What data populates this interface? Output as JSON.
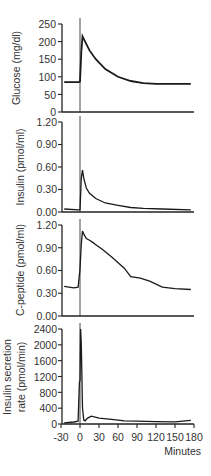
{
  "chart_data": [
    {
      "type": "line",
      "title": "",
      "xlabel": "",
      "ylabel": "Glucose (mg/dl)",
      "ylim": [
        0,
        250
      ],
      "yticks": [
        "0",
        "50",
        "100",
        "150",
        "200",
        "250"
      ],
      "xlim": [
        -30,
        180
      ],
      "injection_marker_x": 0,
      "series": [
        {
          "name": "Glucose",
          "x": [
            -25,
            -2,
            0,
            2,
            4,
            8,
            15,
            25,
            40,
            60,
            80,
            100,
            120,
            150,
            175
          ],
          "values": [
            85,
            85,
            86,
            170,
            215,
            200,
            175,
            150,
            122,
            100,
            88,
            82,
            80,
            80,
            80
          ]
        }
      ]
    },
    {
      "type": "line",
      "ylabel": "Insulin (pmol/ml)",
      "ylim": [
        0,
        1.2
      ],
      "yticks": [
        "0.00",
        "0.30",
        "0.60",
        "0.90",
        "1.20"
      ],
      "xlim": [
        -30,
        180
      ],
      "injection_marker_x": 0,
      "series": [
        {
          "name": "Insulin",
          "x": [
            -25,
            -2,
            0,
            2,
            4,
            6,
            10,
            15,
            25,
            40,
            60,
            80,
            100,
            130,
            175
          ],
          "values": [
            0.04,
            0.03,
            0.03,
            0.45,
            0.56,
            0.45,
            0.32,
            0.25,
            0.18,
            0.12,
            0.09,
            0.06,
            0.05,
            0.04,
            0.03
          ]
        }
      ]
    },
    {
      "type": "line",
      "ylabel": "C-peptide (pmol/ml)",
      "ylim": [
        0,
        1.2
      ],
      "yticks": [
        "0.00",
        "0.30",
        "0.60",
        "0.90",
        "1.20"
      ],
      "xlim": [
        -30,
        180
      ],
      "injection_marker_x": 0,
      "series": [
        {
          "name": "C-peptide",
          "x": [
            -25,
            -10,
            -3,
            0,
            2,
            4,
            6,
            10,
            15,
            20,
            25,
            35,
            50,
            70,
            80,
            95,
            110,
            130,
            150,
            175
          ],
          "values": [
            0.39,
            0.37,
            0.38,
            0.62,
            0.95,
            1.12,
            1.08,
            1.02,
            1.0,
            0.97,
            0.94,
            0.88,
            0.78,
            0.63,
            0.52,
            0.5,
            0.46,
            0.38,
            0.36,
            0.35
          ]
        }
      ]
    },
    {
      "type": "line",
      "ylabel": "Insulin secretion rate (pmol/min)",
      "xlabel": "Minutes",
      "ylim": [
        0,
        2400
      ],
      "yticks": [
        "0",
        "400",
        "800",
        "1200",
        "1600",
        "2000",
        "2400"
      ],
      "xticks": [
        "-30",
        "0",
        "30",
        "60",
        "90",
        "120",
        "150",
        "180"
      ],
      "xlim": [
        -30,
        180
      ],
      "injection_marker_x": 0,
      "series": [
        {
          "name": "Insulin secretion rate",
          "x": [
            -25,
            -10,
            -3,
            -1,
            0,
            1,
            2,
            3,
            4,
            6,
            8,
            12,
            18,
            30,
            50,
            70,
            90,
            120,
            150,
            175
          ],
          "values": [
            30,
            50,
            70,
            1050,
            1100,
            2400,
            2000,
            1200,
            400,
            100,
            80,
            150,
            200,
            150,
            120,
            80,
            70,
            60,
            55,
            90
          ]
        }
      ]
    }
  ],
  "labels": {
    "glucose": "Glucose (mg/dl)",
    "insulin": "Insulin (pmol/ml)",
    "cpeptide": "C-peptide (pmol/ml)",
    "isr_line1": "Insulin secretion",
    "isr_line2": "rate (pmol/min)",
    "minutes": "Minutes"
  },
  "ticks": {
    "glucose": [
      "250",
      "200",
      "150",
      "100",
      "50",
      "0"
    ],
    "insulin": [
      "1.20",
      "0.90",
      "0.60",
      "0.30",
      "0.00"
    ],
    "cpeptide": [
      "1.20",
      "0.90",
      "0.60",
      "0.30",
      "0.00"
    ],
    "isr": [
      "2400",
      "2000",
      "1600",
      "1200",
      "800",
      "400",
      "0"
    ],
    "x": [
      "-30",
      "0",
      "30",
      "60",
      "90",
      "120",
      "150",
      "180"
    ]
  }
}
